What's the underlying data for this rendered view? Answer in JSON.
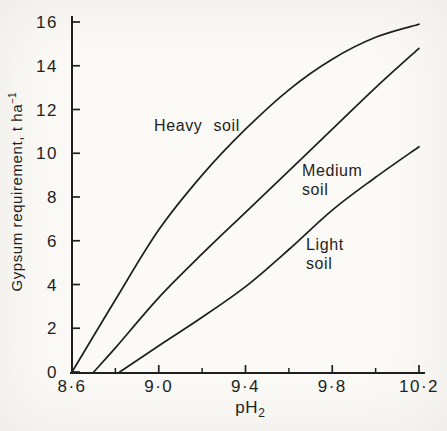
{
  "figure": {
    "background_color": "#fbfaf6",
    "ink_color": "#1f1f1f"
  },
  "chart_data": {
    "type": "line",
    "title": "",
    "xlabel": "pH",
    "xlabel_subscript": "2",
    "ylabel": "Gypsum requirement, t ha",
    "ylabel_superscript": "−1",
    "xlim": [
      8.6,
      10.2
    ],
    "ylim": [
      0,
      16
    ],
    "grid": false,
    "legend_position": "none",
    "x_major_ticks": [
      8.6,
      9.0,
      9.4,
      9.8,
      10.2
    ],
    "x_major_tick_labels": [
      "8·6",
      "9·0",
      "9·4",
      "9·8",
      "10·2"
    ],
    "x_minor_ticks": [
      8.8,
      9.2,
      9.6,
      10.0
    ],
    "y_ticks": [
      0,
      2,
      4,
      6,
      8,
      10,
      12,
      14,
      16
    ],
    "y_tick_labels": [
      "0",
      "2",
      "4",
      "6",
      "8",
      "10",
      "12",
      "14",
      "16"
    ],
    "series": [
      {
        "name": "Heavy soil",
        "x": [
          8.6,
          8.8,
          9.0,
          9.2,
          9.4,
          9.6,
          9.8,
          10.0,
          10.2
        ],
        "y": [
          0,
          3.3,
          6.5,
          9.0,
          11.1,
          12.9,
          14.3,
          15.3,
          15.9
        ]
      },
      {
        "name": "Medium soil",
        "x": [
          8.7,
          8.8,
          9.0,
          9.2,
          9.4,
          9.6,
          9.8,
          10.0,
          10.2
        ],
        "y": [
          0,
          1.1,
          3.4,
          5.4,
          7.3,
          9.2,
          11.1,
          13.0,
          14.8
        ]
      },
      {
        "name": "Light soil",
        "x": [
          8.82,
          9.0,
          9.2,
          9.4,
          9.6,
          9.8,
          10.0,
          10.2
        ],
        "y": [
          0,
          1.2,
          2.5,
          3.9,
          5.6,
          7.4,
          8.9,
          10.3
        ]
      }
    ],
    "annotations": [
      {
        "lines": [
          "Heavy soil"
        ],
        "x": 8.98,
        "y": 11.7
      },
      {
        "lines": [
          "Medium",
          "soil"
        ],
        "x": 9.66,
        "y": 9.65
      },
      {
        "lines": [
          "Light",
          "soil"
        ],
        "x": 9.68,
        "y": 6.25
      }
    ]
  }
}
